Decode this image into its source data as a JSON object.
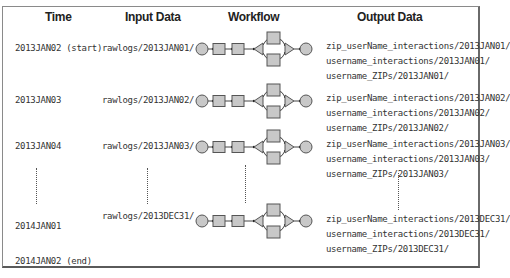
{
  "headers": {
    "time": "Time",
    "input": "Input Data",
    "workflow": "Workflow",
    "output": "Output Data"
  },
  "rows": [
    {
      "time": "2013JAN02 (start)",
      "input": "rawlogs/2013JAN01/",
      "outputs": [
        "zip_userName_interactions/2013JAN01/",
        "username_interactions/2013JAN01/",
        "username_ZIPs/2013JAN01/"
      ]
    },
    {
      "time": "2013JAN03",
      "input": "rawlogs/2013JAN02/",
      "outputs": [
        "zip_userName_interactions/2013JAN02/",
        "username_interactions/2013JAN02/",
        "username_ZIPs/2013JAN02/"
      ]
    },
    {
      "time": "2013JAN04",
      "input": "rawlogs/2013JAN03/",
      "outputs": [
        "zip_userName_interactions/2013JAN03/",
        "username_interactions/2013JAN03/",
        "username_ZIPs/2013JAN03/"
      ]
    },
    {
      "time": "2014JAN01",
      "input": "rawlogs/2013DEC31/",
      "outputs": [
        "zip_userName_interactions/2013DEC31/",
        "username_interactions/2013DEC31/",
        "username_ZIPs/2013DEC31/"
      ]
    }
  ],
  "end_time": "2014JAN02 (end)",
  "workflow_icon": {
    "nodes": [
      "start-circle",
      "action-square",
      "action-square",
      "fork-triangle",
      "parallel-square-top",
      "parallel-square-bottom",
      "join-triangle",
      "end-circle"
    ]
  },
  "colors": {
    "node_fill": "#c8c8c8",
    "node_stroke": "#444444",
    "frame": "#7a7a7a"
  }
}
